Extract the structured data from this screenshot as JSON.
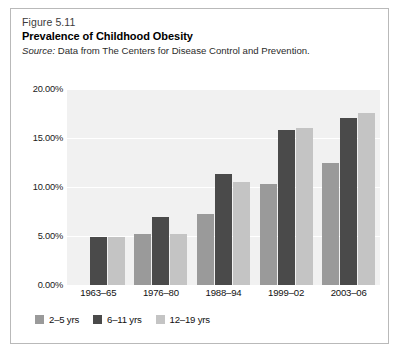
{
  "figure": {
    "number": "Figure 5.11",
    "title": "Prevalence of Childhood Obesity",
    "source_label": "Source:",
    "source_text": " Data from The Centers for Disease Control and Prevention."
  },
  "colors": {
    "series_2_5": "#9a9a9a",
    "series_6_11": "#4a4a4a",
    "series_12_19": "#c4c4c4",
    "plot_background": "#f1f1f1",
    "gridline": "#ffffff",
    "border": "#b9b9b9"
  },
  "chart_data": {
    "type": "bar",
    "title": "Prevalence of Childhood Obesity",
    "xlabel": "",
    "ylabel": "",
    "ylim": [
      0,
      20
    ],
    "yticks": [
      "0.00%",
      "5.00%",
      "10.00%",
      "15.00%",
      "20.00%"
    ],
    "ytick_values": [
      0,
      5,
      10,
      15,
      20
    ],
    "grid": true,
    "legend_position": "bottom-left",
    "categories": [
      "1963–65",
      "1976–80",
      "1988–94",
      "1999–02",
      "2003–06"
    ],
    "series": [
      {
        "name": "2–5 yrs",
        "values": [
          null,
          5.2,
          7.2,
          10.3,
          12.4
        ]
      },
      {
        "name": "6–11 yrs",
        "values": [
          4.9,
          6.9,
          11.3,
          15.8,
          17.0
        ]
      },
      {
        "name": "12–19 yrs",
        "values": [
          4.9,
          5.2,
          10.5,
          16.0,
          17.6
        ]
      }
    ]
  }
}
